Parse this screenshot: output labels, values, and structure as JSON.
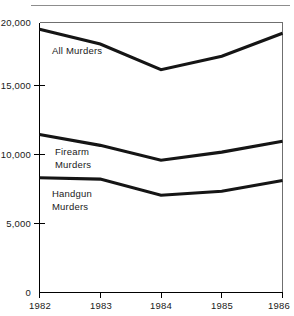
{
  "chart_data": {
    "type": "line",
    "title": "",
    "subtitle": "",
    "xlabel": "",
    "ylabel": "",
    "categories": [
      "1982",
      "1983",
      "1984",
      "1985",
      "1986"
    ],
    "x": [
      1982,
      1983,
      1984,
      1985,
      1986
    ],
    "xlim": [
      1982,
      1986
    ],
    "ylim": [
      0,
      20000
    ],
    "grid": false,
    "legend_position": "inline-annotations",
    "y_ticks": [
      {
        "value": 20000,
        "label": "20,000"
      },
      {
        "value": 15000,
        "label": "15,000"
      },
      {
        "value": 10000,
        "label": "10,000"
      },
      {
        "value": 5000,
        "label": "5,000"
      },
      {
        "value": 0,
        "label": "0"
      }
    ],
    "x_ticks": [
      {
        "value": 1982,
        "label": "1982"
      },
      {
        "value": 1983,
        "label": "1983"
      },
      {
        "value": 1984,
        "label": "1984"
      },
      {
        "value": 1985,
        "label": "1985"
      },
      {
        "value": 1986,
        "label": "1986"
      }
    ],
    "series": [
      {
        "name": "All Murders",
        "label_line1": "All Murders",
        "label_line2": "",
        "color": "#151515",
        "values": [
          19500,
          18400,
          16500,
          17500,
          19200
        ]
      },
      {
        "name": "Firearm Murders",
        "label_line1": "Firearm",
        "label_line2": "Murders",
        "color": "#151515",
        "values": [
          11700,
          10900,
          9800,
          10400,
          11200
        ]
      },
      {
        "name": "Handgun Murders",
        "label_line1": "Handgun",
        "label_line2": "Murders",
        "color": "#151515",
        "values": [
          8500,
          8400,
          7200,
          7500,
          8300
        ]
      }
    ],
    "annotations": [
      {
        "name": "all-murders-label",
        "text": "All Murders",
        "x_px": 52,
        "y_px": 50
      },
      {
        "name": "firearm-murders-label-line1",
        "text": "Firearm",
        "x_px": 55,
        "y_px": 151
      },
      {
        "name": "firearm-murders-label-line2",
        "text": "Murders",
        "x_px": 55,
        "y_px": 164
      },
      {
        "name": "handgun-murders-label-line1",
        "text": "Handgun",
        "x_px": 52,
        "y_px": 193
      },
      {
        "name": "handgun-murders-label-line2",
        "text": "Murders",
        "x_px": 52,
        "y_px": 206
      }
    ]
  }
}
